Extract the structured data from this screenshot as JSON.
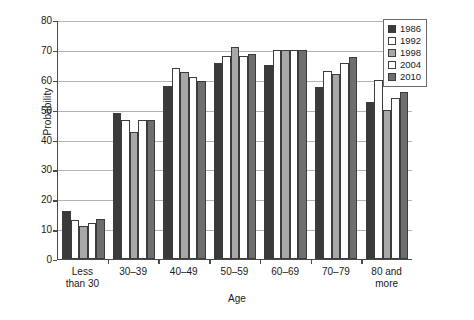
{
  "chart_data": {
    "type": "bar",
    "title": "",
    "xlabel": "Age",
    "ylabel": "Probability",
    "ylim": [
      0,
      80
    ],
    "yticks": [
      0,
      10,
      20,
      30,
      40,
      50,
      60,
      70,
      80
    ],
    "grid": true,
    "legend_position": "top-right",
    "categories": [
      "Less\nthan 30",
      "30–39",
      "40–49",
      "50–59",
      "60–69",
      "70–79",
      "80 and\nmore"
    ],
    "series": [
      {
        "name": "1986",
        "color": "#3a3a3a",
        "values": [
          16.0,
          49.0,
          58.0,
          65.5,
          65.0,
          57.5,
          52.5
        ]
      },
      {
        "name": "1992",
        "color": "#ffffff",
        "values": [
          13.0,
          46.5,
          64.0,
          68.0,
          70.0,
          63.0,
          60.0
        ]
      },
      {
        "name": "1998",
        "color": "#a8a8a8",
        "values": [
          11.0,
          42.5,
          62.5,
          71.0,
          70.0,
          62.0,
          50.0
        ]
      },
      {
        "name": "2004",
        "color": "#ffffff",
        "values": [
          12.0,
          46.5,
          61.0,
          68.0,
          70.0,
          65.5,
          54.0
        ]
      },
      {
        "name": "2010",
        "color": "#6e6e6e",
        "values": [
          13.5,
          46.5,
          59.5,
          68.5,
          70.0,
          67.5,
          56.0
        ]
      }
    ]
  },
  "legend": {
    "items": [
      {
        "label": "1986"
      },
      {
        "label": "1992"
      },
      {
        "label": "1998"
      },
      {
        "label": "2004"
      },
      {
        "label": "2010"
      }
    ]
  }
}
